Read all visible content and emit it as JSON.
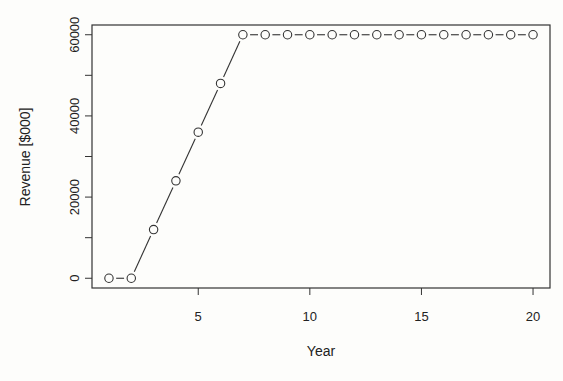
{
  "chart_data": {
    "type": "line",
    "title": "",
    "xlabel": "Year",
    "ylabel": "Revenue [$000]",
    "x": [
      1,
      2,
      3,
      4,
      5,
      6,
      7,
      8,
      9,
      10,
      11,
      12,
      13,
      14,
      15,
      16,
      17,
      18,
      19,
      20
    ],
    "series": [
      {
        "name": "Revenue",
        "values": [
          0,
          0,
          12000,
          24000,
          36000,
          48000,
          60000,
          60000,
          60000,
          60000,
          60000,
          60000,
          60000,
          60000,
          60000,
          60000,
          60000,
          60000,
          60000,
          60000
        ]
      }
    ],
    "x_ticks": [
      5,
      10,
      15,
      20
    ],
    "y_ticks": [
      0,
      20000,
      40000,
      60000
    ],
    "y_minor_ticks": [
      10000,
      30000,
      50000
    ],
    "xlim": [
      0.24,
      20.76
    ],
    "ylim": [
      -2400,
      62400
    ],
    "grid": false,
    "legend": null,
    "style": {
      "line_type": "b",
      "marker": "open-circle",
      "color": "#333333"
    }
  }
}
